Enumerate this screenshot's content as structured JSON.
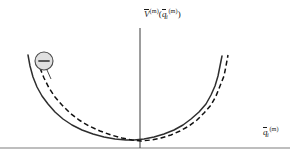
{
  "figure": {
    "background_color": "#ffffff",
    "width": 305,
    "height": 160
  },
  "axes": {
    "y_axis": {
      "label_parts": {
        "v_symbol": "V",
        "v_superscript": "(m)",
        "open_paren": "(",
        "q_symbol": "q",
        "q_subscript": "i",
        "q_superscript": "(m)",
        "close_paren": ")"
      },
      "label_plain": "V̄(m)(q̄i(m))",
      "color": "#3a3a3a",
      "x_position": 140,
      "y_top": 28,
      "y_bottom": 148
    },
    "x_axis": {
      "label_parts": {
        "q_symbol": "q",
        "q_subscript": "i",
        "q_superscript": "(m)"
      },
      "label_plain": "q̄i(m)",
      "color": "#a8a8a8",
      "y_position": 148,
      "x_left": 0,
      "x_right": 290
    }
  },
  "curves": [
    {
      "name": "solid-potential-curve",
      "style": "solid",
      "color": "#2e2e2e",
      "stroke_width": 1.5,
      "description": "Unshifted potential energy curve",
      "points": [
        [
          28,
          55
        ],
        [
          30,
          66
        ],
        [
          33,
          77
        ],
        [
          37,
          87
        ],
        [
          42,
          96
        ],
        [
          48,
          104
        ],
        [
          55,
          112
        ],
        [
          63,
          119
        ],
        [
          72,
          125
        ],
        [
          82,
          130
        ],
        [
          93,
          134
        ],
        [
          104,
          137
        ],
        [
          115,
          139
        ],
        [
          126,
          140
        ],
        [
          134,
          140
        ],
        [
          144,
          139
        ],
        [
          154,
          137
        ],
        [
          164,
          134
        ],
        [
          174,
          130
        ],
        [
          183,
          125
        ],
        [
          191,
          119
        ],
        [
          199,
          112
        ],
        [
          206,
          104
        ],
        [
          211,
          95
        ],
        [
          215,
          86
        ],
        [
          218,
          76
        ],
        [
          220,
          66
        ],
        [
          222,
          56
        ]
      ]
    },
    {
      "name": "dashed-potential-curve",
      "style": "dashed",
      "color": "#111111",
      "stroke_width": 1.5,
      "dash_pattern": "5,3",
      "description": "Shifted potential energy curve",
      "points": [
        [
          40,
          68
        ],
        [
          44,
          78
        ],
        [
          49,
          88
        ],
        [
          55,
          97
        ],
        [
          62,
          105
        ],
        [
          70,
          113
        ],
        [
          79,
          120
        ],
        [
          89,
          126
        ],
        [
          100,
          131
        ],
        [
          111,
          135
        ],
        [
          122,
          138
        ],
        [
          132,
          140
        ],
        [
          141,
          141
        ],
        [
          151,
          140
        ],
        [
          161,
          138
        ],
        [
          171,
          135
        ],
        [
          180,
          131
        ],
        [
          189,
          126
        ],
        [
          197,
          120
        ],
        [
          204,
          113
        ],
        [
          211,
          105
        ],
        [
          216,
          96
        ],
        [
          220,
          86
        ],
        [
          224,
          76
        ],
        [
          226,
          66
        ],
        [
          228,
          55
        ]
      ]
    }
  ],
  "annotation": {
    "name": "minus-sign-marker",
    "symbol": "−",
    "symbol_name": "minus-sign",
    "circle": {
      "cx": 44,
      "cy": 61,
      "r": 9,
      "fill": "#e0e0e0",
      "stroke": "#4a4a4a",
      "stroke_width": 1.1
    },
    "leader_line": {
      "x1": 47,
      "y1": 70,
      "x2": 51,
      "y2": 79,
      "color": "#4a4a4a"
    },
    "meaning": "direction of curve shift"
  }
}
